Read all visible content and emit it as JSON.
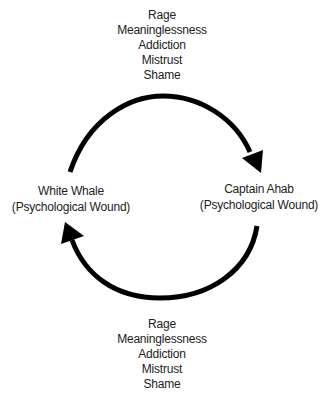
{
  "diagram": {
    "type": "cycle",
    "nodes": [
      {
        "id": "white_whale",
        "title": "White Whale",
        "subtitle": "(Psychological Wound)"
      },
      {
        "id": "captain_ahab",
        "title": "Captain Ahab",
        "subtitle": "(Psychological Wound)"
      }
    ],
    "edges": [
      {
        "from": "white_whale",
        "to": "captain_ahab",
        "position": "top",
        "labels": [
          "Rage",
          "Meaninglessness",
          "Addiction",
          "Mistrust",
          "Shame"
        ]
      },
      {
        "from": "captain_ahab",
        "to": "white_whale",
        "position": "bottom",
        "labels": [
          "Rage",
          "Meaninglessness",
          "Addiction",
          "Mistrust",
          "Shame"
        ]
      }
    ],
    "colors": {
      "arrow": "#000000",
      "text": "#222222",
      "background": "#ffffff"
    }
  }
}
